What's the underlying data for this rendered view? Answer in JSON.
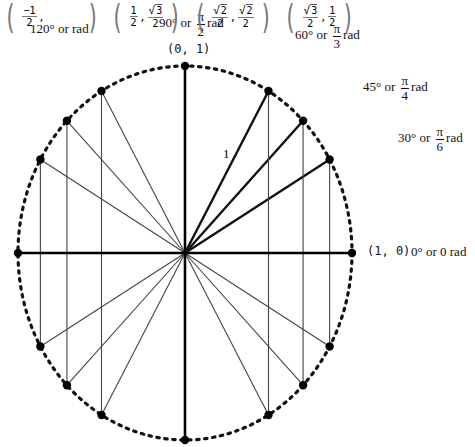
{
  "diagram": {
    "radius_label": "1",
    "angles": [
      {
        "deg": 0,
        "label_deg": "0°",
        "label_rad": "0",
        "coord": "(1, 0)"
      },
      {
        "deg": 30,
        "label_deg": "30°",
        "label_rad_num": "π",
        "label_rad_den": "6",
        "coord_x_num": "√3",
        "coord_x_den": "2",
        "coord_y_num": "1",
        "coord_y_den": "2"
      },
      {
        "deg": 45,
        "label_deg": "45°",
        "label_rad_num": "π",
        "label_rad_den": "4",
        "coord_x_num": "√2",
        "coord_x_den": "2",
        "coord_y_num": "√2",
        "coord_y_den": "2"
      },
      {
        "deg": 60,
        "label_deg": "60°",
        "label_rad_num": "π",
        "label_rad_den": "3",
        "coord_x_num": "1",
        "coord_x_den": "2",
        "coord_y_num": "√3",
        "coord_y_den": "2"
      },
      {
        "deg": 90,
        "label_deg": "90°",
        "label_rad_num": "π",
        "label_rad_den": "2",
        "coord": "(0, 1)"
      },
      {
        "deg": 120,
        "label_deg": "120°",
        "coord_x_num": "−1",
        "coord_x_den": "2"
      },
      {
        "deg": 135
      },
      {
        "deg": 150
      },
      {
        "deg": 180
      },
      {
        "deg": 210
      },
      {
        "deg": 225
      },
      {
        "deg": 240
      },
      {
        "deg": 270
      },
      {
        "deg": 300
      },
      {
        "deg": 315
      },
      {
        "deg": 330
      }
    ],
    "text": {
      "or": "or",
      "rad": "rad",
      "label_0": "0° or 0 rad",
      "label_120": "120° or    rad",
      "coord_0": "(1, 0)",
      "coord_90": "(0, 1)",
      "deg_90": "90° or",
      "deg_60": "60° or",
      "deg_45": "45° or",
      "deg_30": "30° or",
      "pi": "π",
      "den_2": "2",
      "den_3": "3",
      "den_4": "4",
      "den_6": "6",
      "one": "1",
      "neg_one": "−1",
      "sqrt3": "3",
      "sqrt2": "2",
      "comma": ","
    }
  }
}
